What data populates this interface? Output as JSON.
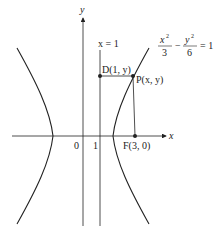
{
  "diagram": {
    "type": "hyperbola",
    "equation": {
      "num1": "x",
      "den1": "3",
      "num2": "y",
      "den2": "6",
      "exp": "2",
      "minus": "−",
      "rhs": "= 1"
    },
    "axes": {
      "x_label": "x",
      "y_label": "y"
    },
    "ticks": {
      "origin": "0",
      "one": "1"
    },
    "directrix_label": "x = 1",
    "points": {
      "D": {
        "label": "D(1, y)"
      },
      "P": {
        "label": "P(x, y)"
      },
      "F": {
        "label": "F(3, 0)"
      }
    },
    "colors": {
      "stroke": "#222222",
      "background": "#ffffff"
    }
  }
}
